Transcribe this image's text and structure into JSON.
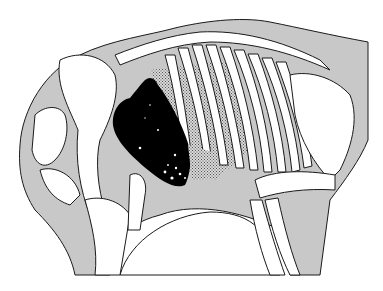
{
  "figure": {
    "colors": {
      "background": "#ffffff",
      "body_outline_fill": "#c8c8c8",
      "bone_fill": "#ffffff",
      "line": "#1a1a1a",
      "heart": "#000000",
      "lung_stipple": "#9a9a9a"
    }
  }
}
